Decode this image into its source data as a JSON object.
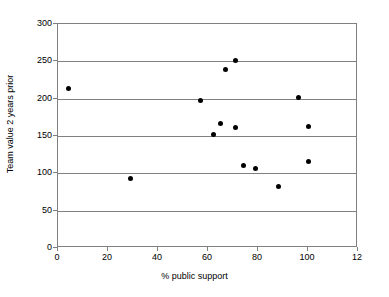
{
  "chart_data": {
    "type": "scatter",
    "title": "",
    "xlabel": "% public support",
    "ylabel": "Team value 2 years prior",
    "xlim": [
      0,
      120
    ],
    "ylim": [
      0,
      300
    ],
    "xticks": [
      0,
      20,
      40,
      60,
      80,
      100,
      120
    ],
    "xtick_labels": [
      "0",
      "20",
      "40",
      "60",
      "80",
      "100",
      "12"
    ],
    "yticks": [
      0,
      50,
      100,
      150,
      200,
      250,
      300
    ],
    "ytick_labels": [
      "0",
      "50",
      "100",
      "150",
      "200",
      "250",
      "300"
    ],
    "grid": "horizontal",
    "legend": null,
    "marker": "filled-diamond",
    "marker_color": "#000000",
    "points": [
      {
        "x": 4,
        "y": 213
      },
      {
        "x": 29,
        "y": 93
      },
      {
        "x": 57,
        "y": 198
      },
      {
        "x": 62,
        "y": 152
      },
      {
        "x": 65,
        "y": 167
      },
      {
        "x": 67,
        "y": 239
      },
      {
        "x": 71,
        "y": 251
      },
      {
        "x": 71,
        "y": 161
      },
      {
        "x": 74,
        "y": 111
      },
      {
        "x": 79,
        "y": 107
      },
      {
        "x": 88,
        "y": 82
      },
      {
        "x": 96,
        "y": 201
      },
      {
        "x": 100,
        "y": 163
      },
      {
        "x": 100,
        "y": 116
      }
    ]
  }
}
